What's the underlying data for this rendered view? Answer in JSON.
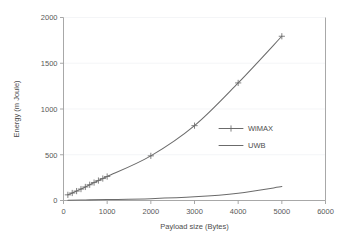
{
  "chart_data": {
    "type": "line",
    "title": "",
    "xlabel": "Payload size (Bytes)",
    "ylabel": "Energy  (m Joule)",
    "xlim": [
      0,
      6000
    ],
    "ylim": [
      0,
      2000
    ],
    "xticks": [
      "0",
      "1000",
      "2000",
      "3000",
      "4000",
      "5000",
      "6000"
    ],
    "xtick_values": [
      0,
      1000,
      2000,
      3000,
      4000,
      5000,
      6000
    ],
    "yticks": [
      "0",
      "500",
      "1000",
      "1500",
      "2000"
    ],
    "ytick_values": [
      0,
      500,
      1000,
      1500,
      2000
    ],
    "grid": "horizontal-light",
    "legend_position": "inside-right-middle",
    "series": [
      {
        "name": "WiMAX",
        "marker": "plus",
        "color": "#6b6b6b",
        "x": [
          100,
          200,
          300,
          400,
          500,
          600,
          700,
          800,
          900,
          1000,
          2000,
          3000,
          4000,
          5000
        ],
        "values": [
          62,
          82,
          103,
          125,
          148,
          172,
          196,
          218,
          240,
          262,
          488,
          818,
          1285,
          1795
        ]
      },
      {
        "name": "UWB",
        "marker": "none",
        "color": "#6b6b6b",
        "x": [
          100,
          500,
          1000,
          2000,
          3000,
          4000,
          5000
        ],
        "values": [
          3,
          6,
          10,
          20,
          40,
          80,
          152
        ]
      }
    ]
  },
  "legend": {
    "items": [
      {
        "label": "WiMAX"
      },
      {
        "label": "UWB"
      }
    ]
  },
  "axes": {
    "x_title": "Payload size (Bytes)",
    "y_title": "Energy  (m Joule)"
  }
}
